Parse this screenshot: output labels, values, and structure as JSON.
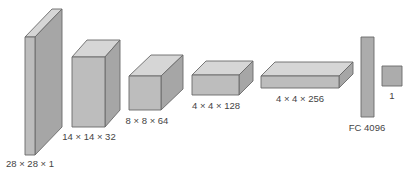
{
  "diagram": {
    "type": "cnn-architecture",
    "colors": {
      "front": "#bdbdbd",
      "top": "#d6d6d6",
      "side": "#a6a6a6",
      "flat": "#acacac",
      "edge": "#6a6a6a",
      "text": "#444444"
    },
    "layers": [
      {
        "id": "input",
        "label": "28 × 28 × 1",
        "kind": "box",
        "front": {
          "x": 25,
          "y": 37,
          "w": 10,
          "h": 118
        },
        "depth": {
          "dx": 27,
          "dy": -28
        },
        "label_pos": {
          "x": 30,
          "y": 159
        }
      },
      {
        "id": "conv1",
        "label": "14 × 14 × 32",
        "kind": "box",
        "front": {
          "x": 72,
          "y": 57,
          "w": 33,
          "h": 70
        },
        "depth": {
          "dx": 15,
          "dy": -17
        },
        "label_pos": {
          "x": 89,
          "y": 132
        }
      },
      {
        "id": "conv2",
        "label": "8 × 8 × 64",
        "kind": "box",
        "front": {
          "x": 129,
          "y": 76,
          "w": 32,
          "h": 34
        },
        "depth": {
          "dx": 22,
          "dy": -21
        },
        "label_pos": {
          "x": 147,
          "y": 116
        }
      },
      {
        "id": "conv3",
        "label": "4 × 4 × 128",
        "kind": "box",
        "front": {
          "x": 192,
          "y": 75,
          "w": 47,
          "h": 20
        },
        "depth": {
          "dx": 14,
          "dy": -14
        },
        "label_pos": {
          "x": 216,
          "y": 101
        }
      },
      {
        "id": "conv4",
        "label": "4 × 4 × 256",
        "kind": "box",
        "front": {
          "x": 261,
          "y": 76,
          "w": 78,
          "h": 12
        },
        "depth": {
          "dx": 14,
          "dy": -14
        },
        "label_pos": {
          "x": 300,
          "y": 94
        }
      },
      {
        "id": "fc",
        "label": "FC 4096",
        "kind": "rect",
        "front": {
          "x": 361,
          "y": 37,
          "w": 13,
          "h": 80
        },
        "label_pos": {
          "x": 367,
          "y": 123
        }
      },
      {
        "id": "output",
        "label": "1",
        "kind": "rect",
        "front": {
          "x": 382,
          "y": 66,
          "w": 20,
          "h": 20
        },
        "label_pos": {
          "x": 392,
          "y": 91
        }
      }
    ]
  }
}
